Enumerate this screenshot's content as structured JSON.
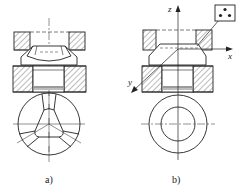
{
  "figures": [
    {
      "id": "a",
      "caption": "a)",
      "inner_shape": "rounded-triangle",
      "outer_shape": "circle",
      "segments": 3
    },
    {
      "id": "b",
      "caption": "b)",
      "inner_shape": "circle",
      "outer_shape": "circle"
    }
  ],
  "axes": {
    "z": "z",
    "x": "x",
    "y": "y"
  },
  "symbol_box": {
    "dots": 3
  },
  "colors": {
    "line": "#222222",
    "hatch": "#555555",
    "background": "#ffffff"
  }
}
